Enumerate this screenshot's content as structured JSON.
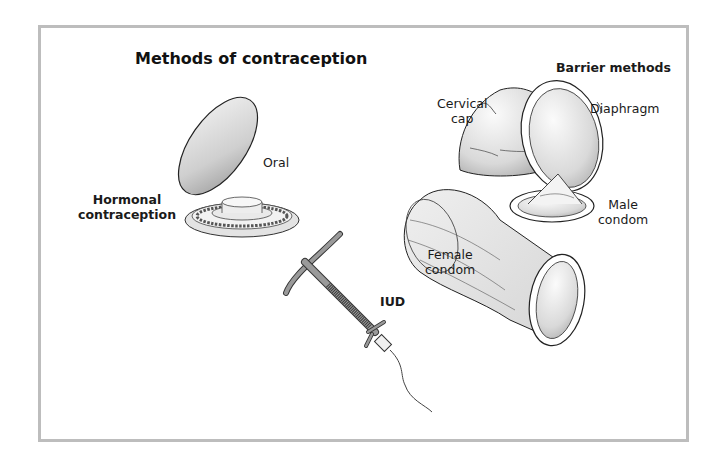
{
  "title": "Methods of contraception",
  "groups": {
    "hormonal": {
      "heading": "Hormonal contraception",
      "heading_lines": [
        "Hormonal",
        "contraception"
      ],
      "items": [
        {
          "label": "Oral",
          "icon": "pill-pack-icon"
        }
      ]
    },
    "iud": {
      "label": "IUD",
      "icon": "iud-icon"
    },
    "barrier": {
      "heading": "Barrier methods",
      "items": [
        {
          "label": "Cervical cap",
          "lines": [
            "Cervical",
            "cap"
          ],
          "icon": "cervical-cap-icon"
        },
        {
          "label": "Diaphragm",
          "lines": [
            "Diaphragm"
          ],
          "icon": "diaphragm-icon"
        },
        {
          "label": "Male condom",
          "lines": [
            "Male",
            "condom"
          ],
          "icon": "male-condom-icon"
        },
        {
          "label": "Female condom",
          "lines": [
            "Female",
            "condom"
          ],
          "icon": "female-condom-icon"
        }
      ]
    }
  },
  "colors": {
    "frame": "#bdbdbd",
    "text": "#1a1a1a",
    "device_gray": "#8a8a8a",
    "light_fill": "#e6e6e6"
  }
}
